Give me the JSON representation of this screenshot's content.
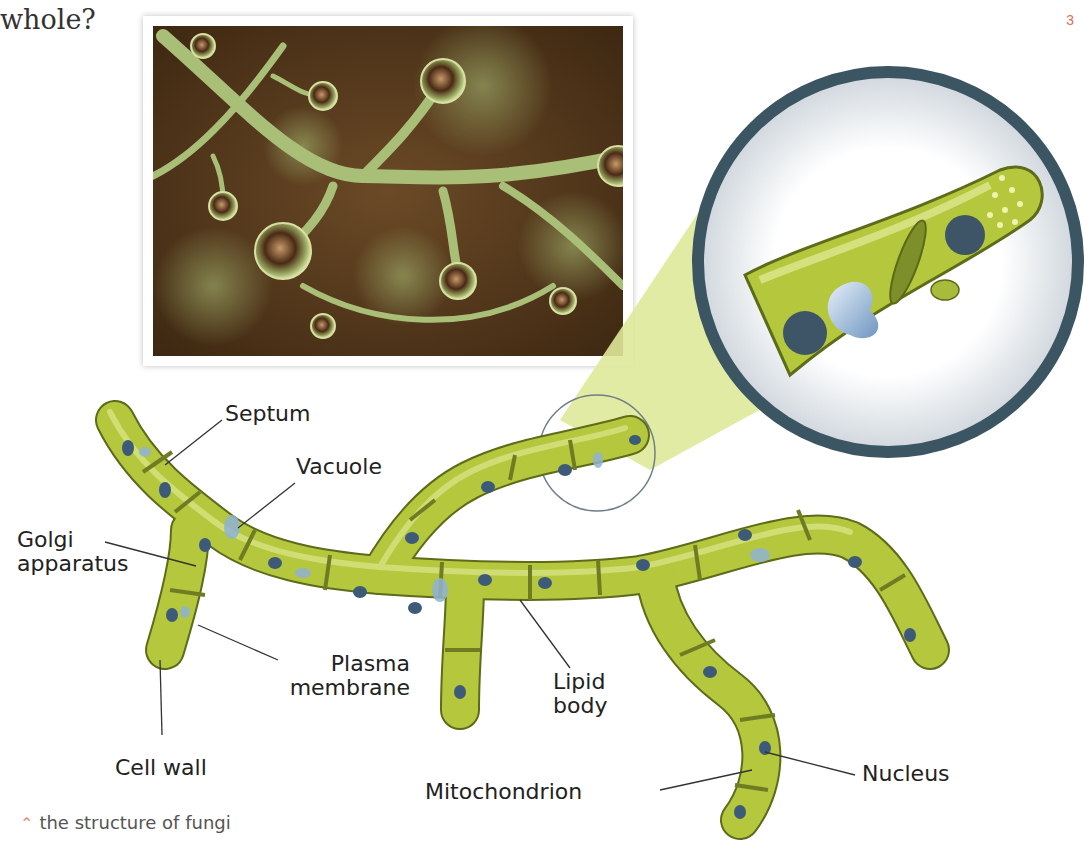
{
  "page": {
    "heading": "whole?",
    "page_number": "3"
  },
  "photo": {
    "subject": "micrograph of fungal hyphae with sporangia"
  },
  "magnifier": {
    "subject": "close-up of hyphal tip showing septum, nuclei, vacuole, golgi, mitochondria, lipid bodies"
  },
  "labels": {
    "septum": "Septum",
    "vacuole": "Vacuole",
    "golgi_line1": "Golgi",
    "golgi_line2": "apparatus",
    "plasma_line1": "Plasma",
    "plasma_line2": "membrane",
    "lipid_line1": "Lipid",
    "lipid_line2": "body",
    "cell_wall": "Cell wall",
    "mitochondrion": "Mitochondrion",
    "nucleus": "Nucleus"
  },
  "caption": {
    "icon": "double-chevron-up-icon",
    "text": "the structure of fungi"
  },
  "colors": {
    "hypha_fill": "#b5c73c",
    "hypha_stroke": "#5d6b1a",
    "nucleus": "#3d5a78",
    "magnifier_ring": "#3c5563",
    "cone": "#dfe99a",
    "photo_bg": "#5a3a1e"
  }
}
